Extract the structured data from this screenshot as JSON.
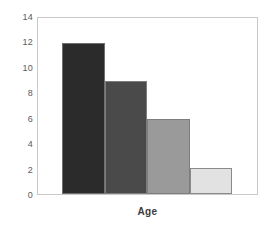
{
  "chart_data": {
    "type": "bar",
    "title": "",
    "subtitle": "",
    "xlabel": "Age",
    "ylabel": "",
    "categories": [
      "",
      "",
      "",
      ""
    ],
    "values": [
      12,
      9,
      6,
      2.1
    ],
    "ylim": [
      0,
      14
    ],
    "xlim": [
      0,
      4
    ],
    "y_ticks": [
      0,
      2,
      4,
      6,
      8,
      10,
      12,
      14
    ],
    "y_tick_labels": [
      "0",
      "2",
      "4",
      "6",
      "8",
      "10",
      "12",
      "14"
    ],
    "x_tick_labels": [],
    "grid": false,
    "legend": null,
    "legend_position": "none",
    "annotations": [],
    "bars": [
      {
        "label": "",
        "value": 12,
        "color": "#2b2b2b",
        "edge_color": "#6f6f6f"
      },
      {
        "label": "",
        "value": 9,
        "color": "#4a4a4a",
        "edge_color": "#7d7d7d"
      },
      {
        "label": "",
        "value": 6,
        "color": "#9a9a9a",
        "edge_color": "#7d7d7d"
      },
      {
        "label": "",
        "value": 2.1,
        "color": "#e2e2e2",
        "edge_color": "#8a8a8a"
      }
    ],
    "colors": {
      "background": "#ffffff",
      "plot_background": "#ffffff",
      "frame": "#c9c9c9",
      "tick_label": "#5a5a5a",
      "axis_title": "#3c3c3c"
    }
  }
}
